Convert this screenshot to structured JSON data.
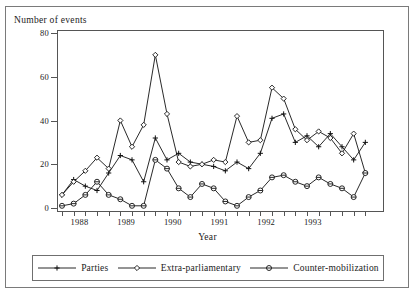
{
  "figure": {
    "ylabel": "Number of events",
    "xlabel": "Year"
  },
  "legend": {
    "items": [
      {
        "label": "Parties",
        "marker": "plus-marker"
      },
      {
        "label": "Extra-parliamentary",
        "marker": "diamond-marker"
      },
      {
        "label": "Counter-mobilization",
        "marker": "circle-bar-marker"
      }
    ]
  },
  "chart_data": {
    "type": "line",
    "title": "",
    "xlabel": "Year",
    "ylabel": "Number of events",
    "xlim": [
      0,
      27
    ],
    "ylim": [
      0,
      80
    ],
    "yticks": [
      0,
      20,
      40,
      60,
      80
    ],
    "xticks": [
      0,
      1,
      2,
      3,
      4,
      5,
      6,
      7,
      8,
      9,
      10,
      11,
      12,
      13,
      14,
      15,
      16,
      17,
      18,
      19,
      20,
      21,
      22,
      23,
      24,
      25,
      26
    ],
    "xtick_labels": [
      "1988",
      "1989",
      "1990",
      "1991",
      "1992",
      "1993"
    ],
    "xtick_label_positions": [
      1.5,
      5.5,
      9.5,
      13.5,
      17.5,
      21.5
    ],
    "grid": false,
    "legend_position": "below",
    "x": [
      0,
      1,
      2,
      3,
      4,
      5,
      6,
      7,
      8,
      9,
      10,
      11,
      12,
      13,
      14,
      15,
      16,
      17,
      18,
      19,
      20,
      21,
      22,
      23,
      24,
      25,
      26
    ],
    "series": [
      {
        "name": "Parties",
        "marker": "plus",
        "values": [
          6,
          13,
          10,
          8,
          16,
          24,
          22,
          12,
          32,
          22,
          25,
          21,
          20,
          19,
          17,
          21,
          18,
          25,
          41,
          43,
          30,
          33,
          28,
          34,
          28,
          22,
          30
        ]
      },
      {
        "name": "Extra-parliamentary",
        "marker": "diamond",
        "values": [
          6,
          12,
          17,
          23,
          18,
          40,
          28,
          38,
          70,
          43,
          21,
          19,
          20,
          22,
          21,
          42,
          30,
          31,
          55,
          50,
          36,
          31,
          35,
          32,
          25,
          34,
          16
        ]
      },
      {
        "name": "Counter-mobilization",
        "marker": "circle-bar",
        "values": [
          1,
          2,
          6,
          12,
          6,
          4,
          1,
          1,
          22,
          18,
          9,
          5,
          11,
          9,
          3,
          1,
          5,
          8,
          14,
          15,
          12,
          10,
          14,
          11,
          9,
          5,
          16
        ]
      }
    ]
  }
}
